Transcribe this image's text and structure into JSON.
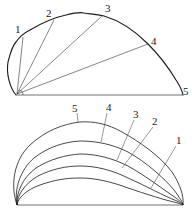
{
  "diagram": {
    "top_figure": {
      "labels": [
        "1",
        "2",
        "3",
        "4",
        "5"
      ]
    },
    "bottom_figure": {
      "labels": [
        "5",
        "4",
        "3",
        "2",
        "1"
      ]
    }
  }
}
